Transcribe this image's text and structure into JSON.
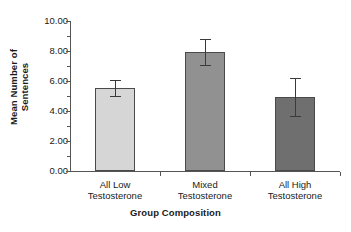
{
  "chart_data": {
    "type": "bar",
    "title": "",
    "xlabel": "Group Composition",
    "ylabel": "Mean Number of Sentences",
    "categories": [
      "All Low Testosterone",
      "Mixed Testosterone",
      "All High Testosterone"
    ],
    "category_lines": [
      [
        "All Low",
        "Testosterone"
      ],
      [
        "Mixed",
        "Testosterone"
      ],
      [
        "All High",
        "Testosterone"
      ]
    ],
    "values": [
      5.55,
      7.95,
      4.95
    ],
    "errors": [
      0.55,
      0.85,
      1.25
    ],
    "bar_colors": [
      "#d6d6d6",
      "#919191",
      "#6f6f6f"
    ],
    "ylim": [
      0,
      10
    ],
    "ytick_values": [
      0,
      2,
      4,
      6,
      8,
      10
    ],
    "ytick_labels": [
      "0.00",
      "2.00",
      "4.00",
      "6.00",
      "8.00",
      "10.00"
    ],
    "yminor_values": [
      1,
      3,
      5,
      7,
      9
    ],
    "grid": false,
    "legend": false,
    "error_bar_style": "symmetric-caps"
  },
  "axis": {
    "y_title_lines": [
      "Mean Number of",
      "Sentences"
    ],
    "x_title": "Group Composition"
  }
}
